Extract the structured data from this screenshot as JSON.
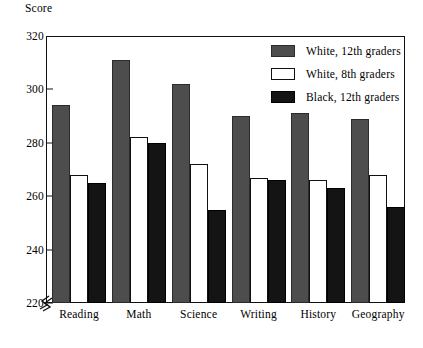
{
  "chart_data": {
    "type": "bar",
    "title": "",
    "xlabel": "",
    "ylabel": "Score",
    "ylim": [
      220,
      320
    ],
    "yticks": [
      220,
      240,
      260,
      280,
      300,
      320
    ],
    "grid": false,
    "axis_break": true,
    "legend_position": "top-right inside plot",
    "categories": [
      "Reading",
      "Math",
      "Science",
      "Writing",
      "History",
      "Geography"
    ],
    "series": [
      {
        "name": "White, 12th graders",
        "color": "#4d4d4d",
        "values": [
          294,
          311,
          302,
          290,
          291,
          289
        ]
      },
      {
        "name": "White, 8th graders",
        "color": "#ffffff",
        "values": [
          268,
          282,
          272,
          267,
          266,
          268
        ]
      },
      {
        "name": "Black, 12th graders",
        "color": "#141414",
        "values": [
          265,
          280,
          255,
          266,
          263,
          256
        ]
      }
    ]
  }
}
